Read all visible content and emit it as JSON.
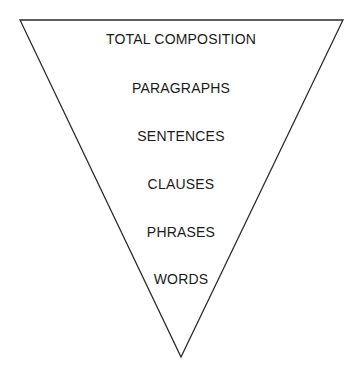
{
  "diagram": {
    "type": "inverted-triangle-hierarchy",
    "shape": {
      "top_left": [
        20,
        20
      ],
      "top_right": [
        343,
        20
      ],
      "apex": [
        181,
        357
      ],
      "stroke_color": "#2a2a2a"
    },
    "levels": [
      {
        "label": "TOTAL COMPOSITION",
        "y": 31
      },
      {
        "label": "PARAGRAPHS",
        "y": 80
      },
      {
        "label": "SENTENCES",
        "y": 128
      },
      {
        "label": "CLAUSES",
        "y": 176
      },
      {
        "label": "PHRASES",
        "y": 224
      },
      {
        "label": "WORDS",
        "y": 271
      }
    ]
  }
}
